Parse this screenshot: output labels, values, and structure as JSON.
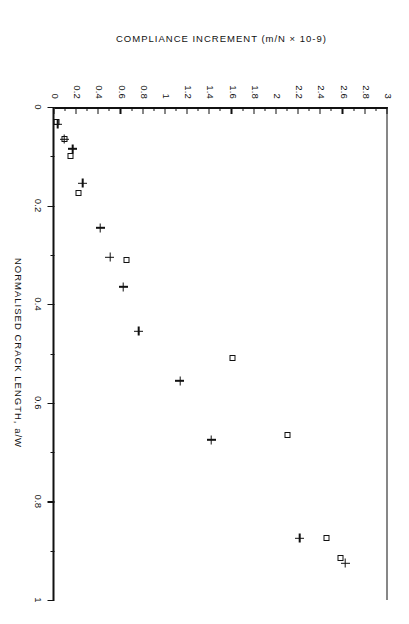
{
  "chart_data": {
    "type": "scatter",
    "title": "",
    "xlabel": "NORMALISED CRACK LENGTH, a/W",
    "ylabel": "COMPLIANCE INCREMENT (m/N × 10-9)",
    "xlim": [
      0,
      1
    ],
    "ylim": [
      0,
      3
    ],
    "grid": false,
    "legend": "none",
    "xticks": [
      "0",
      "0.2",
      "0.4",
      "0.6",
      "0.8",
      "1"
    ],
    "xtick_values": [
      0,
      0.2,
      0.4,
      0.6,
      0.8,
      1
    ],
    "xminor_step": 0.1,
    "yticks": [
      "0",
      "0.2",
      "0.4",
      "0.6",
      "0.8",
      "1",
      "1.2",
      "1.4",
      "1.6",
      "1.8",
      "2",
      "2.2",
      "2.4",
      "2.6",
      "2.8",
      "3"
    ],
    "ytick_values": [
      0,
      0.2,
      0.4,
      0.6,
      0.8,
      1,
      1.2,
      1.4,
      1.6,
      1.8,
      2,
      2.2,
      2.4,
      2.6,
      2.8,
      3
    ],
    "series": [
      {
        "name": "square-series",
        "marker": "square",
        "points": [
          {
            "x": 0.03,
            "y": 0.02
          },
          {
            "x": 0.065,
            "y": 0.09
          },
          {
            "x": 0.1,
            "y": 0.14
          },
          {
            "x": 0.175,
            "y": 0.22
          },
          {
            "x": 0.31,
            "y": 0.65
          },
          {
            "x": 0.51,
            "y": 1.6
          },
          {
            "x": 0.665,
            "y": 2.1
          },
          {
            "x": 0.875,
            "y": 2.45
          },
          {
            "x": 0.915,
            "y": 2.58
          }
        ]
      },
      {
        "name": "plus-series",
        "marker": "plus",
        "points": [
          {
            "x": 0.035,
            "y": 0.03
          },
          {
            "x": 0.065,
            "y": 0.09
          },
          {
            "x": 0.085,
            "y": 0.165
          },
          {
            "x": 0.155,
            "y": 0.255
          },
          {
            "x": 0.245,
            "y": 0.41
          },
          {
            "x": 0.305,
            "y": 0.5
          },
          {
            "x": 0.365,
            "y": 0.62
          },
          {
            "x": 0.455,
            "y": 0.76
          },
          {
            "x": 0.555,
            "y": 1.13
          },
          {
            "x": 0.675,
            "y": 1.41
          },
          {
            "x": 0.875,
            "y": 2.21
          },
          {
            "x": 0.925,
            "y": 2.62
          }
        ]
      }
    ]
  }
}
